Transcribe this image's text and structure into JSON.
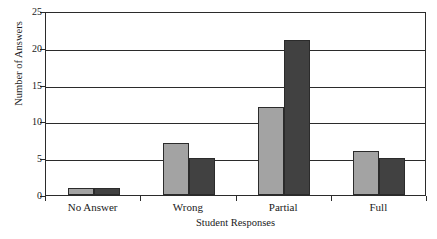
{
  "chart_data": {
    "type": "bar",
    "title": "",
    "xlabel": "Student Responses",
    "ylabel": "Number of Answers",
    "categories": [
      "No Answer",
      "Wrong",
      "Partial",
      "Full"
    ],
    "series": [
      {
        "name": "series-a",
        "color": "#a3a3a3",
        "values": [
          1,
          7,
          12,
          6
        ]
      },
      {
        "name": "series-b",
        "color": "#414141",
        "values": [
          1,
          5,
          21,
          5
        ]
      }
    ],
    "ylim": [
      0,
      25
    ],
    "yticks": [
      0,
      5,
      10,
      15,
      20,
      25
    ],
    "ytick_labels": [
      "0",
      "5",
      "10",
      "15",
      "20",
      "25"
    ],
    "grid": true,
    "grid_axis": "y",
    "legend": false,
    "legend_position": "none",
    "bar_border_color": "#2b2b2b",
    "axis_color": "#2b2b2b",
    "background": "#ffffff"
  },
  "axes": {
    "y_title": "Number of Answers",
    "x_title": "Student Responses"
  }
}
